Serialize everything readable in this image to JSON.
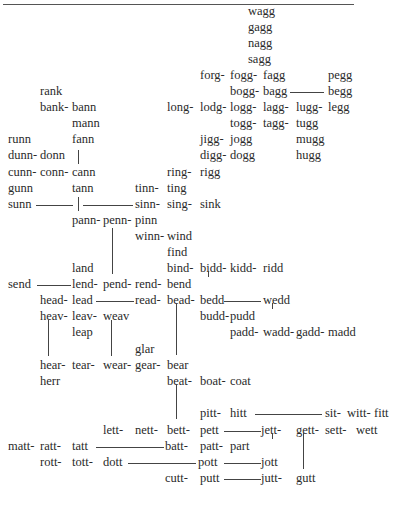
{
  "diagram": {
    "type": "word-transformation-network",
    "words": [
      {
        "t": "wagg",
        "x": 248,
        "y": 4
      },
      {
        "t": "gagg",
        "x": 248,
        "y": 20
      },
      {
        "t": "nagg",
        "x": 248,
        "y": 36
      },
      {
        "t": "sagg",
        "x": 248,
        "y": 52
      },
      {
        "t": "forg-",
        "x": 200,
        "y": 68
      },
      {
        "t": "fogg-",
        "x": 230,
        "y": 68
      },
      {
        "t": "fagg",
        "x": 263,
        "y": 68
      },
      {
        "t": "pegg",
        "x": 328,
        "y": 68
      },
      {
        "t": "bogg-",
        "x": 230,
        "y": 84
      },
      {
        "t": "bagg",
        "x": 263,
        "y": 84
      },
      {
        "t": "begg",
        "x": 328,
        "y": 84
      },
      {
        "t": "rank",
        "x": 40,
        "y": 84
      },
      {
        "t": "bank-",
        "x": 40,
        "y": 100
      },
      {
        "t": "bann",
        "x": 72,
        "y": 100
      },
      {
        "t": "long-",
        "x": 167,
        "y": 100
      },
      {
        "t": "lodg-",
        "x": 200,
        "y": 100
      },
      {
        "t": "logg-",
        "x": 230,
        "y": 100
      },
      {
        "t": "lagg-",
        "x": 263,
        "y": 100
      },
      {
        "t": "lugg-",
        "x": 296,
        "y": 100
      },
      {
        "t": "legg",
        "x": 328,
        "y": 100
      },
      {
        "t": "mann",
        "x": 72,
        "y": 116
      },
      {
        "t": "togg-",
        "x": 230,
        "y": 116
      },
      {
        "t": "tagg-",
        "x": 263,
        "y": 116
      },
      {
        "t": "tugg",
        "x": 296,
        "y": 116
      },
      {
        "t": "runn",
        "x": 8,
        "y": 132
      },
      {
        "t": "fann",
        "x": 72,
        "y": 132
      },
      {
        "t": "jigg-",
        "x": 200,
        "y": 132
      },
      {
        "t": "jogg",
        "x": 230,
        "y": 132
      },
      {
        "t": "mugg",
        "x": 296,
        "y": 132
      },
      {
        "t": "dunn-",
        "x": 8,
        "y": 148
      },
      {
        "t": "donn",
        "x": 40,
        "y": 148
      },
      {
        "t": "digg-",
        "x": 200,
        "y": 148
      },
      {
        "t": "dogg",
        "x": 230,
        "y": 148
      },
      {
        "t": "hugg",
        "x": 296,
        "y": 148
      },
      {
        "t": "cunn-",
        "x": 8,
        "y": 165
      },
      {
        "t": "conn-",
        "x": 40,
        "y": 165
      },
      {
        "t": "cann",
        "x": 72,
        "y": 165
      },
      {
        "t": "ring-",
        "x": 167,
        "y": 165
      },
      {
        "t": "rigg",
        "x": 200,
        "y": 165
      },
      {
        "t": "gunn",
        "x": 8,
        "y": 181
      },
      {
        "t": "tann",
        "x": 72,
        "y": 181
      },
      {
        "t": "tinn-",
        "x": 135,
        "y": 181
      },
      {
        "t": "ting",
        "x": 167,
        "y": 181
      },
      {
        "t": "sunn",
        "x": 8,
        "y": 197
      },
      {
        "t": "sinn-",
        "x": 135,
        "y": 197
      },
      {
        "t": "sing-",
        "x": 167,
        "y": 197
      },
      {
        "t": "sink",
        "x": 200,
        "y": 197
      },
      {
        "t": "pann-",
        "x": 72,
        "y": 213
      },
      {
        "t": "penn-",
        "x": 103,
        "y": 213
      },
      {
        "t": "pinn",
        "x": 135,
        "y": 213
      },
      {
        "t": "winn-",
        "x": 135,
        "y": 229
      },
      {
        "t": "wind",
        "x": 167,
        "y": 229
      },
      {
        "t": "find",
        "x": 167,
        "y": 245
      },
      {
        "t": "land",
        "x": 72,
        "y": 261
      },
      {
        "t": "bind-",
        "x": 167,
        "y": 261
      },
      {
        "t": "bidd-",
        "x": 200,
        "y": 261
      },
      {
        "t": "kidd-",
        "x": 230,
        "y": 261
      },
      {
        "t": "ridd",
        "x": 263,
        "y": 261
      },
      {
        "t": "send",
        "x": 8,
        "y": 277
      },
      {
        "t": "lend-",
        "x": 72,
        "y": 277
      },
      {
        "t": "pend-",
        "x": 103,
        "y": 277
      },
      {
        "t": "rend-",
        "x": 135,
        "y": 277
      },
      {
        "t": "bend",
        "x": 167,
        "y": 277
      },
      {
        "t": "head-",
        "x": 40,
        "y": 293
      },
      {
        "t": "lead",
        "x": 72,
        "y": 293
      },
      {
        "t": "read-",
        "x": 135,
        "y": 293
      },
      {
        "t": "bead-",
        "x": 167,
        "y": 293
      },
      {
        "t": "bedd",
        "x": 200,
        "y": 293
      },
      {
        "t": "wedd",
        "x": 263,
        "y": 293
      },
      {
        "t": "heav-",
        "x": 40,
        "y": 309
      },
      {
        "t": "leav-",
        "x": 72,
        "y": 309
      },
      {
        "t": "weav",
        "x": 103,
        "y": 309
      },
      {
        "t": "budd-",
        "x": 200,
        "y": 309
      },
      {
        "t": "pudd",
        "x": 230,
        "y": 309
      },
      {
        "t": "leap",
        "x": 72,
        "y": 325
      },
      {
        "t": "padd-",
        "x": 230,
        "y": 325
      },
      {
        "t": "wadd-",
        "x": 263,
        "y": 325
      },
      {
        "t": "gadd-",
        "x": 296,
        "y": 325
      },
      {
        "t": "madd",
        "x": 328,
        "y": 325
      },
      {
        "t": "glar",
        "x": 135,
        "y": 342
      },
      {
        "t": "hear-",
        "x": 40,
        "y": 358
      },
      {
        "t": "tear-",
        "x": 72,
        "y": 358
      },
      {
        "t": "wear-",
        "x": 103,
        "y": 358
      },
      {
        "t": "gear-",
        "x": 135,
        "y": 358
      },
      {
        "t": "bear",
        "x": 167,
        "y": 358
      },
      {
        "t": "herr",
        "x": 40,
        "y": 374
      },
      {
        "t": "beat-",
        "x": 167,
        "y": 374
      },
      {
        "t": "boat-",
        "x": 200,
        "y": 374
      },
      {
        "t": "coat",
        "x": 230,
        "y": 374
      },
      {
        "t": "pitt-",
        "x": 200,
        "y": 406
      },
      {
        "t": "hitt",
        "x": 230,
        "y": 406
      },
      {
        "t": "sit-",
        "x": 325,
        "y": 406
      },
      {
        "t": "witt-",
        "x": 347,
        "y": 406
      },
      {
        "t": "fitt",
        "x": 374,
        "y": 406
      },
      {
        "t": "lett-",
        "x": 103,
        "y": 423
      },
      {
        "t": "nett-",
        "x": 135,
        "y": 423
      },
      {
        "t": "bett-",
        "x": 167,
        "y": 423
      },
      {
        "t": "pett",
        "x": 200,
        "y": 423
      },
      {
        "t": "jett-",
        "x": 261,
        "y": 423
      },
      {
        "t": "gett-",
        "x": 296,
        "y": 423
      },
      {
        "t": "sett-",
        "x": 325,
        "y": 423
      },
      {
        "t": "wett",
        "x": 356,
        "y": 423
      },
      {
        "t": "matt-",
        "x": 8,
        "y": 439
      },
      {
        "t": "ratt-",
        "x": 40,
        "y": 439
      },
      {
        "t": "tatt",
        "x": 72,
        "y": 439
      },
      {
        "t": "batt-",
        "x": 165,
        "y": 439
      },
      {
        "t": "patt-",
        "x": 200,
        "y": 439
      },
      {
        "t": "part",
        "x": 230,
        "y": 439
      },
      {
        "t": "rott-",
        "x": 40,
        "y": 455
      },
      {
        "t": "tott-",
        "x": 72,
        "y": 455
      },
      {
        "t": "dott",
        "x": 103,
        "y": 455
      },
      {
        "t": "pott",
        "x": 198,
        "y": 455
      },
      {
        "t": "jott",
        "x": 261,
        "y": 455
      },
      {
        "t": "cutt-",
        "x": 165,
        "y": 471
      },
      {
        "t": "putt",
        "x": 200,
        "y": 471
      },
      {
        "t": "jutt-",
        "x": 261,
        "y": 471
      },
      {
        "t": "gutt",
        "x": 296,
        "y": 471
      }
    ],
    "hlines": [
      {
        "x": 290,
        "y": 92,
        "w": 34
      },
      {
        "x": 36,
        "y": 205,
        "w": 37
      },
      {
        "x": 83,
        "y": 205,
        "w": 50
      },
      {
        "x": 37,
        "y": 285,
        "w": 34
      },
      {
        "x": 96,
        "y": 301,
        "w": 38
      },
      {
        "x": 224,
        "y": 301,
        "w": 37
      },
      {
        "x": 255,
        "y": 414,
        "w": 67
      },
      {
        "x": 224,
        "y": 431,
        "w": 37
      },
      {
        "x": 96,
        "y": 447,
        "w": 68
      },
      {
        "x": 128,
        "y": 463,
        "w": 68
      },
      {
        "x": 224,
        "y": 463,
        "w": 37
      },
      {
        "x": 224,
        "y": 479,
        "w": 37
      }
    ],
    "vlines": [
      {
        "x": 78,
        "y": 150,
        "h": 14
      },
      {
        "x": 78,
        "y": 197,
        "h": 14
      },
      {
        "x": 112,
        "y": 228,
        "h": 46
      },
      {
        "x": 208,
        "y": 271,
        "h": 6
      },
      {
        "x": 272,
        "y": 303,
        "h": 6
      },
      {
        "x": 176,
        "y": 303,
        "h": 52
      },
      {
        "x": 48,
        "y": 320,
        "h": 36
      },
      {
        "x": 111,
        "y": 320,
        "h": 36
      },
      {
        "x": 176,
        "y": 384,
        "h": 35
      },
      {
        "x": 272,
        "y": 433,
        "h": 6
      },
      {
        "x": 303,
        "y": 433,
        "h": 36
      }
    ]
  }
}
